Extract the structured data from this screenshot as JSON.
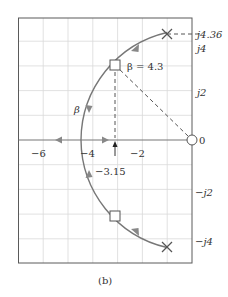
{
  "figure": {
    "caption": "(b)",
    "type": "root-locus-plot"
  },
  "axes": {
    "x_ticks": [
      {
        "value": -6,
        "label": "−6"
      },
      {
        "value": -4,
        "label": "−4"
      },
      {
        "value": -2,
        "label": "−2"
      },
      {
        "value": 0,
        "label": "0"
      }
    ],
    "y_ticks": [
      {
        "value": 4,
        "label": "j4"
      },
      {
        "value": 2,
        "label": "j2"
      },
      {
        "value": -2,
        "label": "−j2"
      },
      {
        "value": -4,
        "label": "−j4"
      }
    ],
    "x_range": [
      -7,
      0
    ],
    "y_range": [
      -4.95,
      4.95
    ],
    "grid": true
  },
  "annotations": {
    "pole_imag_label": "j4.36",
    "beta_value_label": "β = 4.3",
    "beta_label": "β",
    "breakin_label": "−3.15",
    "origin_label": "0"
  },
  "markers": {
    "poles": [
      {
        "re": -1,
        "im": 4.36,
        "symbol": "x"
      },
      {
        "re": -1,
        "im": -4.36,
        "symbol": "x"
      }
    ],
    "zero": {
      "re": 0,
      "im": 0,
      "symbol": "o"
    },
    "operating_points": [
      {
        "re": -3.15,
        "im": 3.17,
        "symbol": "square"
      },
      {
        "re": -3.15,
        "im": -3.17,
        "symbol": "square"
      }
    ]
  },
  "colors": {
    "locus": "#777777",
    "grid": "#d6d6d6",
    "frame": "#555555",
    "text": "#333333"
  }
}
